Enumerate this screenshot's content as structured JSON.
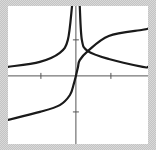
{
  "chart_data": {
    "type": "line",
    "title": "",
    "xlabel": "",
    "ylabel": "",
    "xlim": [
      -1.94,
      2.06
    ],
    "ylim": [
      -1.89,
      1.94
    ],
    "grid": false,
    "legend": "none",
    "x_ticks": [
      -1,
      1
    ],
    "y_ticks": [
      -1,
      1
    ],
    "tick_labels_shown": false,
    "colors": {
      "curve": "#1a1a1a",
      "axis": "#555555",
      "background": "#ffffff"
    },
    "series": [
      {
        "name": "odd-curve",
        "points": [
          [
            -1.94,
            -1.22
          ],
          [
            -1.03,
            -1.0
          ],
          [
            -0.46,
            -0.81
          ],
          [
            -0.17,
            -0.53
          ],
          [
            -0.06,
            -0.22
          ],
          [
            0,
            0
          ],
          [
            0.06,
            0.25
          ],
          [
            0.11,
            0.44
          ],
          [
            0.34,
            0.69
          ],
          [
            0.94,
            1.11
          ],
          [
            1.91,
            1.28
          ],
          [
            2.06,
            1.31
          ]
        ]
      },
      {
        "name": "even-curve-left",
        "points": [
          [
            -1.94,
            0.25
          ],
          [
            -1.03,
            0.39
          ],
          [
            -0.46,
            0.64
          ],
          [
            -0.23,
            1.0
          ],
          [
            -0.11,
            1.94
          ]
        ]
      },
      {
        "name": "even-curve-right",
        "points": [
          [
            0.11,
            1.94
          ],
          [
            0.17,
            1.0
          ],
          [
            0.34,
            0.69
          ],
          [
            0.94,
            0.47
          ],
          [
            1.91,
            0.25
          ],
          [
            2.06,
            0.25
          ]
        ]
      }
    ]
  }
}
